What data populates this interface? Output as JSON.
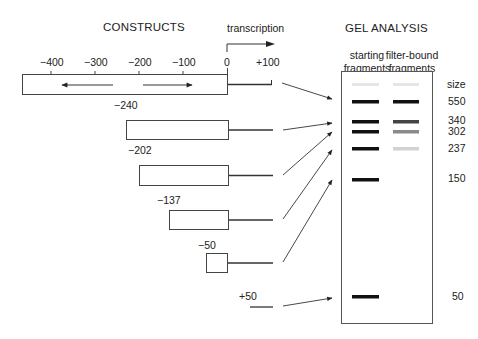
{
  "headers": {
    "constructs": "CONSTRUCTS",
    "gel_analysis": "GEL  ANALYSIS",
    "transcription": "transcription"
  },
  "scale": {
    "ticks": [
      "−400",
      "−300",
      "−200",
      "−100",
      "0",
      "+100"
    ],
    "ltr_label": "LTR"
  },
  "constructs": [
    {
      "label": "",
      "start": -450,
      "description": "full-length LTR construct"
    },
    {
      "label": "−240",
      "start": -240
    },
    {
      "label": "−202",
      "start": -202
    },
    {
      "label": "−137",
      "start": -137
    },
    {
      "label": "−50",
      "start": -50
    },
    {
      "label": "+50",
      "start": 50
    }
  ],
  "gel": {
    "lanes": [
      {
        "label_line1": "starting",
        "label_line2": "fragments"
      },
      {
        "label_line1": "filter-bound",
        "label_line2": "fragments"
      }
    ],
    "size_header": "size",
    "sizes": [
      "550",
      "340",
      "302",
      "237",
      "150",
      "50"
    ],
    "bands": [
      {
        "size": "marker",
        "lane1": "#e6e6e6",
        "lane2": "#e6e6e6"
      },
      {
        "size": "550",
        "lane1": "#111111",
        "lane2": "#111111"
      },
      {
        "size": "340",
        "lane1": "#111111",
        "lane2": "#444444"
      },
      {
        "size": "302",
        "lane1": "#111111",
        "lane2": "#8a8a8a"
      },
      {
        "size": "237",
        "lane1": "#111111",
        "lane2": "#d2d2d2"
      },
      {
        "size": "150",
        "lane1": "#111111",
        "lane2": null
      },
      {
        "size": "50",
        "lane1": "#111111",
        "lane2": null
      }
    ]
  },
  "colors": {
    "line": "#333333",
    "box_stroke": "#444444"
  }
}
